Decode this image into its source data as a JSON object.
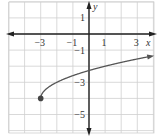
{
  "chart_data": {
    "type": "line",
    "title": "",
    "xlabel": "x",
    "ylabel": "y",
    "xlim": [
      -5,
      4
    ],
    "ylim": [
      -6,
      2
    ],
    "grid": true,
    "x_ticks": [
      {
        "value": -3,
        "label": "−3"
      },
      {
        "value": -1,
        "label": "−1"
      },
      {
        "value": 1,
        "label": "1"
      },
      {
        "value": 3,
        "label": "3"
      }
    ],
    "y_ticks": [
      {
        "value": 1,
        "label": "1"
      },
      {
        "value": -1,
        "label": "−1"
      },
      {
        "value": -3,
        "label": "−3"
      },
      {
        "value": -5,
        "label": "−5"
      }
    ],
    "series": [
      {
        "name": "y = sqrt(x+3) - 4",
        "start_point": {
          "x": -3,
          "y": -4,
          "closed": true
        },
        "end_arrow": true,
        "x": [
          -3,
          -2.9,
          -2.75,
          -2.5,
          -2,
          -1.5,
          -1,
          0,
          1,
          2,
          3,
          4
        ],
        "y": [
          -4,
          -3.68,
          -3.5,
          -3.29,
          -3,
          -2.78,
          -2.59,
          -2.27,
          -2,
          -1.76,
          -1.55,
          -1.35
        ]
      }
    ],
    "colors": {
      "grid": "#cfcfcf",
      "axis": "#222222",
      "curve": "#555555",
      "text": "#333333"
    }
  }
}
